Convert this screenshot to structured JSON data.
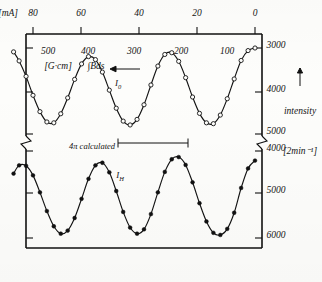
{
  "figure": {
    "kind": "scientific-plot",
    "orientation": "rotated-90-ccw",
    "paper_color": "#fdfdfb",
    "ink_color": "#131313"
  },
  "axes": {
    "value_axis": {
      "label": "intensity",
      "units": "[2min⁻¹]",
      "arrow": "←",
      "has_break": true,
      "segment_upper": {
        "name": "I_H scale",
        "ticks": [
          6000,
          5000,
          4000
        ]
      },
      "segment_lower": {
        "name": "I_0 scale",
        "ticks": [
          5000,
          4000,
          3000
        ]
      },
      "tick_labels": [
        "6000",
        "5000",
        "4000",
        "5000",
        "4000",
        "3000"
      ]
    },
    "field_axis": {
      "primary_label": "∫Bds",
      "primary_units": "[G·cm]",
      "primary_ticks": [
        100,
        200,
        300,
        400,
        500
      ],
      "primary_tick_labels": [
        "100",
        "200",
        "300",
        "400",
        "500"
      ],
      "secondary_units": "[mA]",
      "secondary_ticks": [
        0,
        20,
        40,
        60,
        80
      ],
      "secondary_tick_labels": [
        "0",
        "20",
        "40",
        "60",
        "80"
      ],
      "arrow": "→"
    }
  },
  "annotations": {
    "curve_h_label": "I",
    "curve_h_sub": "H",
    "curve_o_label": "I",
    "curve_o_sub": "0",
    "error_bar_label": "4π calculated"
  },
  "chart_data": {
    "type": "line",
    "title": "",
    "xlabel": "∫Bds [G·cm]  /  [mA]",
    "ylabel": "intensity [2min⁻¹]",
    "grid": false,
    "legend": "inline-annotations",
    "xlim": [
      0,
      88
    ],
    "x_secondary_lim": [
      0,
      560
    ],
    "series": [
      {
        "name": "I_H",
        "marker": "filled-circle",
        "ylim": [
          3850,
          6150
        ],
        "points": [
          {
            "x": 0,
            "y": 4220
          },
          {
            "x": 2.5,
            "y": 4400
          },
          {
            "x": 5,
            "y": 4850
          },
          {
            "x": 7.5,
            "y": 5420
          },
          {
            "x": 10,
            "y": 5790
          },
          {
            "x": 12.5,
            "y": 5930
          },
          {
            "x": 15,
            "y": 5880
          },
          {
            "x": 17.5,
            "y": 5620
          },
          {
            "x": 20,
            "y": 5200
          },
          {
            "x": 22.5,
            "y": 4720
          },
          {
            "x": 25,
            "y": 4320
          },
          {
            "x": 27.5,
            "y": 4140
          },
          {
            "x": 30,
            "y": 4190
          },
          {
            "x": 32.5,
            "y": 4480
          },
          {
            "x": 35,
            "y": 4950
          },
          {
            "x": 37.5,
            "y": 5450
          },
          {
            "x": 40,
            "y": 5800
          },
          {
            "x": 42.5,
            "y": 5900
          },
          {
            "x": 45,
            "y": 5760
          },
          {
            "x": 47.5,
            "y": 5400
          },
          {
            "x": 50,
            "y": 4920
          },
          {
            "x": 52.5,
            "y": 4490
          },
          {
            "x": 55,
            "y": 4270
          },
          {
            "x": 57.5,
            "y": 4330
          },
          {
            "x": 60,
            "y": 4640
          },
          {
            "x": 62.5,
            "y": 5100
          },
          {
            "x": 65,
            "y": 5540
          },
          {
            "x": 67.5,
            "y": 5830
          },
          {
            "x": 70,
            "y": 5900
          },
          {
            "x": 72.5,
            "y": 5730
          },
          {
            "x": 75,
            "y": 5380
          },
          {
            "x": 77.5,
            "y": 4950
          },
          {
            "x": 80,
            "y": 4560
          },
          {
            "x": 82.5,
            "y": 4340
          },
          {
            "x": 85,
            "y": 4330
          },
          {
            "x": 87,
            "y": 4520
          }
        ]
      },
      {
        "name": "I_0",
        "marker": "open-circle",
        "ylim": [
          2850,
          5150
        ],
        "points": [
          {
            "x": 0,
            "y": 3000
          },
          {
            "x": 2.5,
            "y": 3060
          },
          {
            "x": 5,
            "y": 3290
          },
          {
            "x": 7.5,
            "y": 3720
          },
          {
            "x": 10,
            "y": 4180
          },
          {
            "x": 12.5,
            "y": 4560
          },
          {
            "x": 15,
            "y": 4760
          },
          {
            "x": 17.5,
            "y": 4740
          },
          {
            "x": 20,
            "y": 4520
          },
          {
            "x": 22.5,
            "y": 4140
          },
          {
            "x": 25,
            "y": 3690
          },
          {
            "x": 27.5,
            "y": 3310
          },
          {
            "x": 30,
            "y": 3110
          },
          {
            "x": 32.5,
            "y": 3150
          },
          {
            "x": 35,
            "y": 3420
          },
          {
            "x": 37.5,
            "y": 3860
          },
          {
            "x": 40,
            "y": 4320
          },
          {
            "x": 42.5,
            "y": 4660
          },
          {
            "x": 45,
            "y": 4790
          },
          {
            "x": 47.5,
            "y": 4700
          },
          {
            "x": 50,
            "y": 4400
          },
          {
            "x": 52.5,
            "y": 3980
          },
          {
            "x": 55,
            "y": 3560
          },
          {
            "x": 57.5,
            "y": 3270
          },
          {
            "x": 60,
            "y": 3200
          },
          {
            "x": 62.5,
            "y": 3370
          },
          {
            "x": 65,
            "y": 3730
          },
          {
            "x": 67.5,
            "y": 4160
          },
          {
            "x": 70,
            "y": 4530
          },
          {
            "x": 72.5,
            "y": 4740
          },
          {
            "x": 75,
            "y": 4720
          },
          {
            "x": 77.5,
            "y": 4480
          },
          {
            "x": 80,
            "y": 4100
          },
          {
            "x": 82.5,
            "y": 3660
          },
          {
            "x": 85,
            "y": 3300
          },
          {
            "x": 87,
            "y": 3090
          }
        ]
      }
    ],
    "error_bar": {
      "label": "4π calculated",
      "x": 30,
      "span_intensity": 1100
    }
  }
}
